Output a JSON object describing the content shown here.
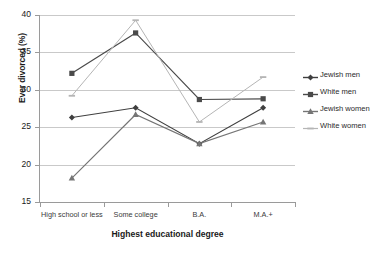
{
  "chart_data": {
    "type": "line",
    "title": "",
    "xlabel": "Highest educational degree",
    "ylabel": "Ever divorced (%)",
    "categories": [
      "High school or less",
      "Some college",
      "B.A.",
      "M.A.+"
    ],
    "ylim": [
      15,
      40
    ],
    "yticks": [
      15,
      20,
      25,
      30,
      35,
      40
    ],
    "grid": true,
    "legend_position": "right",
    "series": [
      {
        "name": "Jewish men",
        "values": [
          26.3,
          27.6,
          22.8,
          27.6
        ],
        "color": "#3f3f3f",
        "marker": "diamond"
      },
      {
        "name": "White men",
        "values": [
          32.2,
          37.6,
          28.7,
          28.8
        ],
        "color": "#4a4a4a",
        "marker": "square"
      },
      {
        "name": "Jewish women",
        "values": [
          18.2,
          26.7,
          22.8,
          25.7
        ],
        "color": "#757575",
        "marker": "triangle"
      },
      {
        "name": "White women",
        "values": [
          29.2,
          39.3,
          25.7,
          31.7
        ],
        "color": "#b5b5b5",
        "marker": "line"
      }
    ]
  },
  "axes": {
    "y_title": "Ever divorced (%)",
    "x_title": "Highest educational degree",
    "y_tick_labels": [
      "40",
      "35",
      "30",
      "25",
      "20",
      "15"
    ],
    "x_tick_labels": [
      "High school or less",
      "Some college",
      "B.A.",
      "M.A.+"
    ]
  },
  "legend": {
    "items": [
      {
        "label": "Jewish men"
      },
      {
        "label": "White men"
      },
      {
        "label": "Jewish women"
      },
      {
        "label": "White women"
      }
    ]
  }
}
